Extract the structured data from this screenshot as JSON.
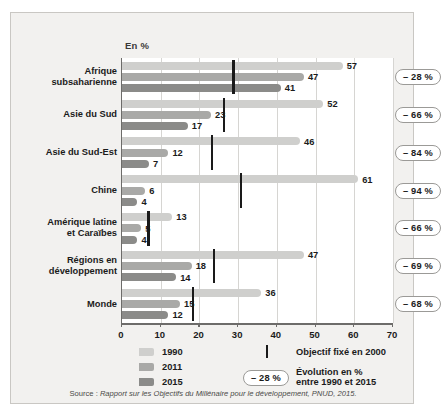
{
  "figure": {
    "unit_label": "En %",
    "source": "Source : Rapport sur les Objectifs du Millénaire pour le développement, PNUD, 2015.",
    "source_prefix": "Source : "
  },
  "legend": {
    "series": [
      {
        "label": "1990",
        "color": "#cfcfcd"
      },
      {
        "label": "2011",
        "color": "#a9a9a7"
      },
      {
        "label": "2015",
        "color": "#8b8b89"
      }
    ],
    "target_label": "Objectif fixé en 2000",
    "evolution_sample": "– 28 %",
    "evolution_label_line1": "Évolution en %",
    "evolution_label_line2": "entre 1990 et 2015"
  },
  "axis": {
    "ticks": [
      "0",
      "10",
      "20",
      "30",
      "40",
      "50",
      "60",
      "70"
    ],
    "tick_values": [
      0,
      10,
      20,
      30,
      40,
      50,
      60,
      70
    ]
  },
  "chart_data": {
    "type": "bar",
    "orientation": "horizontal",
    "title": "",
    "subtitle": "",
    "xlabel": "En %",
    "ylabel": "",
    "xlim": [
      0,
      70
    ],
    "grid": true,
    "legend_position": "bottom-left",
    "categories": [
      "Afrique subsaharienne",
      "Asie du Sud",
      "Asie du Sud-Est",
      "Chine",
      "Amérique latine et Caraïbes",
      "Régions en développement",
      "Monde"
    ],
    "category_lines": [
      [
        "Afrique",
        "subsaharienne"
      ],
      [
        "Asie du Sud"
      ],
      [
        "Asie du Sud-Est"
      ],
      [
        "Chine"
      ],
      [
        "Amérique latine",
        "et Caraïbes"
      ],
      [
        "Régions en",
        "développement"
      ],
      [
        "Monde"
      ]
    ],
    "series": [
      {
        "name": "1990",
        "color": "#cfcfcd",
        "values": [
          57,
          52,
          46,
          61,
          13,
          47,
          36
        ]
      },
      {
        "name": "2011",
        "color": "#a9a9a7",
        "values": [
          47,
          23,
          12,
          6,
          5,
          18,
          15
        ]
      },
      {
        "name": "2015",
        "color": "#8b8b89",
        "values": [
          41,
          17,
          7,
          4,
          4,
          14,
          12
        ]
      }
    ],
    "targets": {
      "name": "Objectif fixé en 2000",
      "color": "#1a1a1a",
      "values": [
        28.5,
        26,
        23,
        30.5,
        6.5,
        23.5,
        18
      ]
    },
    "evolution": {
      "name": "Évolution en % entre 1990 et 2015",
      "values": [
        "– 28 %",
        "– 66 %",
        "– 84 %",
        "– 94 %",
        "– 66 %",
        "– 69 %",
        "– 68 %"
      ]
    }
  }
}
